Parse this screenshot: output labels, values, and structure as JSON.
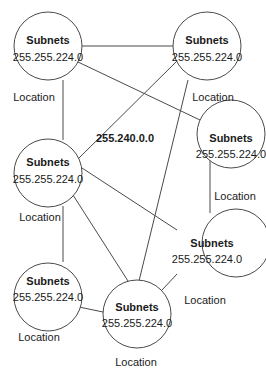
{
  "diagram": {
    "center_label": "255.240.0.0",
    "nodes": [
      {
        "id": "A",
        "title": "Subnets",
        "mask": "255.255.224.0",
        "location": "Location"
      },
      {
        "id": "B",
        "title": "Subnets",
        "mask": "255.255.224.0",
        "location": "Location"
      },
      {
        "id": "C",
        "title": "Subnets",
        "mask": "255.255.224.0",
        "location": "Location"
      },
      {
        "id": "D",
        "title": "Subnets",
        "mask": "255.255.224.0",
        "location": "Location"
      },
      {
        "id": "E",
        "title": "Subnets",
        "mask": "255.255.224.0",
        "location": "Location"
      },
      {
        "id": "F",
        "title": "Subnets",
        "mask": "255.255.224.0",
        "location": "Location"
      },
      {
        "id": "G",
        "title": "Subnets",
        "mask": "255.255.224.0",
        "location": "Location"
      }
    ],
    "edges": [
      [
        "A",
        "B"
      ],
      [
        "A",
        "C"
      ],
      [
        "A",
        "D"
      ],
      [
        "B",
        "D"
      ],
      [
        "B",
        "G"
      ],
      [
        "C",
        "E"
      ],
      [
        "D",
        "E"
      ],
      [
        "D",
        "G"
      ],
      [
        "D",
        "F"
      ],
      [
        "F",
        "G"
      ],
      [
        "G",
        "E"
      ]
    ],
    "colors": {
      "stroke": "#4a4a4a",
      "text": "#1a1a1a",
      "background": "#ffffff"
    }
  }
}
